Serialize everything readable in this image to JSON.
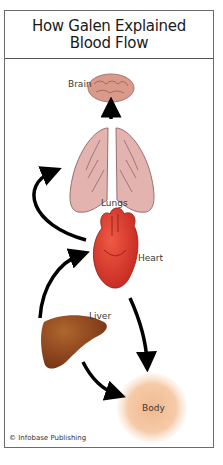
{
  "header": {
    "title_line1": "How Galen Explained",
    "title_line2": "Blood Flow"
  },
  "organs": {
    "brain": "Brain",
    "lungs": "Lungs",
    "heart": "Heart",
    "liver": "Liver",
    "body": "Body"
  },
  "flow": [
    {
      "from": "Liver",
      "to": "Heart"
    },
    {
      "from": "Liver",
      "to": "Body"
    },
    {
      "from": "Heart",
      "to": "Lungs"
    },
    {
      "from": "Heart",
      "to": "Body"
    },
    {
      "from": "Lungs",
      "to": "Brain"
    }
  ],
  "colors": {
    "brain": "#d99a8c",
    "lungs": "#e3b3b0",
    "heart": "#d9362b",
    "liver": "#8a3f1c",
    "body": "#f2c39f",
    "arrow": "#000000"
  },
  "credit": "© Infobase Publishing"
}
